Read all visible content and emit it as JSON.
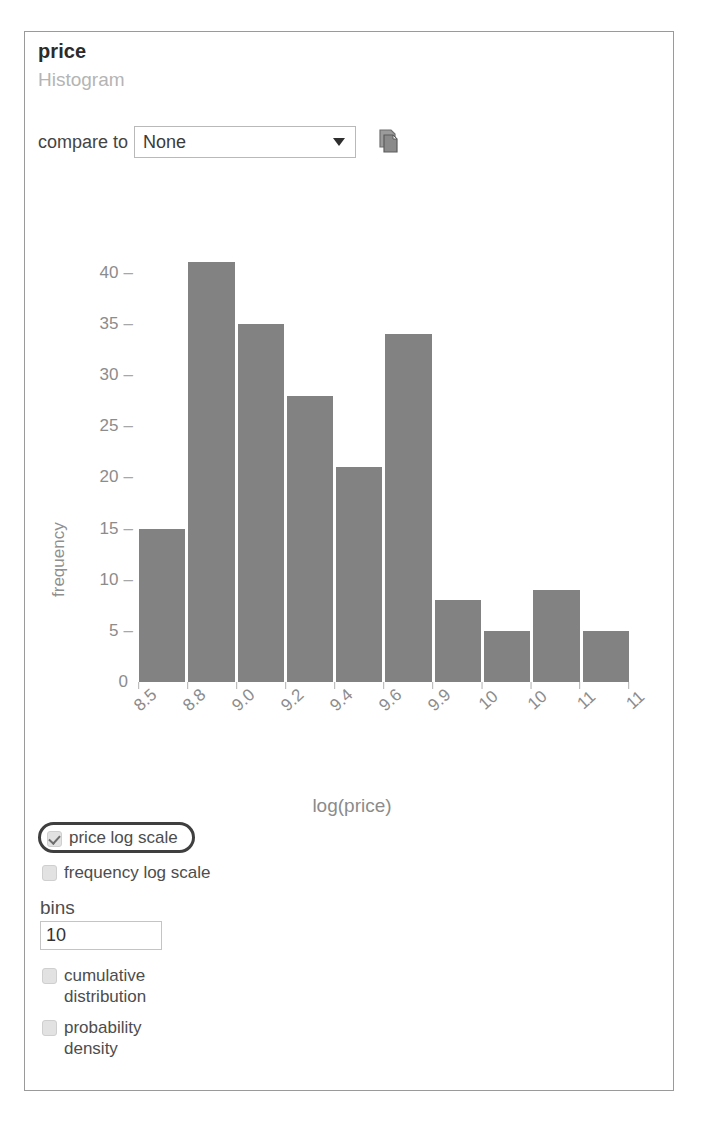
{
  "panel": {
    "title": "price",
    "subtitle": "Histogram"
  },
  "compare": {
    "label": "compare to",
    "selected": "None",
    "options": [
      "None"
    ],
    "arrow_icon": "chevron-down-icon",
    "copy_icon": "copy-icon"
  },
  "chart_data": {
    "type": "bar",
    "title": "",
    "xlabel": "log(price)",
    "ylabel": "frequency",
    "categories": [
      "8.5",
      "8.8",
      "9.0",
      "9.2",
      "9.4",
      "9.6",
      "9.9",
      "10",
      "10",
      "11"
    ],
    "values": [
      15,
      41,
      35,
      28,
      21,
      34,
      8,
      5,
      9,
      5
    ],
    "x_tick_labels": [
      "8.5",
      "8.8",
      "9.0",
      "9.2",
      "9.4",
      "9.6",
      "9.9",
      "10",
      "10",
      "11",
      "11"
    ],
    "y_tick_labels": [
      "40",
      "35",
      "30",
      "25",
      "20",
      "15",
      "10",
      "5",
      "0"
    ],
    "y_tick_values": [
      40,
      35,
      30,
      25,
      20,
      15,
      10,
      5,
      0
    ],
    "ylim": [
      0,
      43
    ],
    "grid": false,
    "legend": null,
    "bar_color": "#828282"
  },
  "controls": {
    "price_log_scale": {
      "label": "price log scale",
      "checked": true,
      "highlighted": true
    },
    "frequency_log_scale": {
      "label": "frequency log scale",
      "checked": false
    },
    "bins": {
      "label": "bins",
      "value": "10"
    },
    "cumulative_distribution": {
      "label": "cumulative distribution",
      "checked": false
    },
    "probability_density": {
      "label": "probability density",
      "checked": false
    }
  }
}
